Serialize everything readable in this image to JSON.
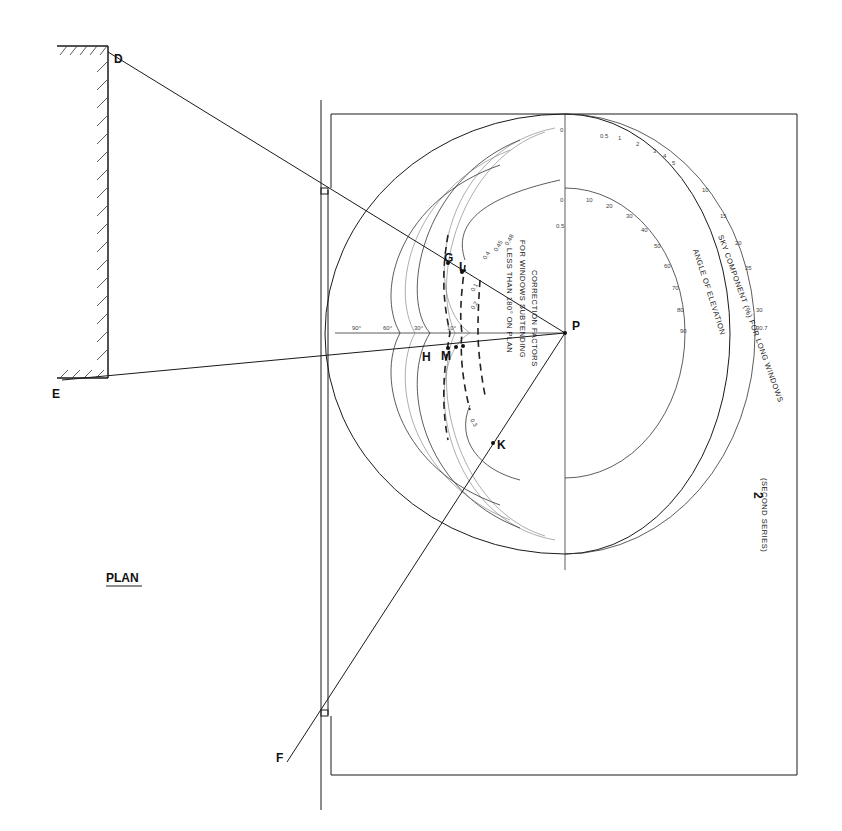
{
  "diagram": {
    "type": "daylight-protractor-plan",
    "points": {
      "D": "D",
      "E": "E",
      "F": "F",
      "G": "G",
      "L": "L",
      "H": "H",
      "M": "M",
      "K": "K",
      "P": "P"
    },
    "plan_label": "PLAN",
    "protractor": {
      "number": "2",
      "series": "(SECOND SERIES)",
      "sky_component_caption": "SKY COMPONENT (%) FOR LONG WINDOWS",
      "elevation_caption": "ANGLE OF ELEVATION",
      "correction_caption_line1": "CORRECTION FACTORS",
      "correction_caption_line2": "FOR WINDOWS SUBTENDING",
      "correction_caption_line3": "LESS THAN 180° ON PLAN",
      "sky_component_ticks": [
        "0.5",
        "1",
        "2",
        "3",
        "4",
        "5",
        "10",
        "15",
        "20",
        "25",
        "30",
        "30.7"
      ],
      "elevation_ticks": [
        "10",
        "20",
        "30",
        "40",
        "50",
        "60",
        "70",
        "80",
        "90"
      ],
      "axis_ticks": [
        "0",
        "0",
        "0.5"
      ],
      "correction_ticks": [
        "0.4",
        "0.45",
        "0.48",
        "0.1",
        "0.2",
        "0.3"
      ],
      "angle_ticks": [
        "90°",
        "60°",
        "30°",
        "10°"
      ]
    }
  }
}
